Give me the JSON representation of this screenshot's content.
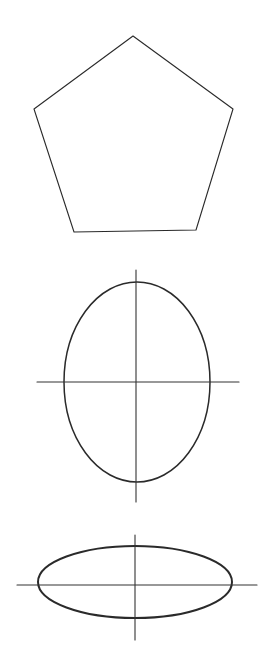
{
  "canvas": {
    "width": 268,
    "height": 671,
    "background": "#ffffff"
  },
  "colors": {
    "line": "#2a2a2a",
    "axis": "#333333"
  },
  "figures": [
    {
      "name": "pentagon",
      "type": "polygon",
      "points": [
        [
          133,
          36
        ],
        [
          233,
          109
        ],
        [
          196,
          230
        ],
        [
          74,
          232
        ],
        [
          34,
          109
        ]
      ],
      "stroke_width": 1.1
    },
    {
      "name": "tall-ellipse",
      "type": "ellipse",
      "cx": 137,
      "cy": 382,
      "rx": 73,
      "ry": 100,
      "stroke_width": 1.5,
      "axes": {
        "horizontal": {
          "x1": 37,
          "x2": 239,
          "y": 382
        },
        "vertical": {
          "x": 136,
          "y1": 270,
          "y2": 502
        }
      }
    },
    {
      "name": "wide-ellipse",
      "type": "ellipse",
      "cx": 135,
      "cy": 582,
      "rx": 97,
      "ry": 36,
      "stroke_width": 2,
      "axes": {
        "horizontal": {
          "x1": 17,
          "x2": 257,
          "y": 585
        },
        "vertical": {
          "x": 135,
          "y1": 535,
          "y2": 640
        }
      }
    }
  ]
}
